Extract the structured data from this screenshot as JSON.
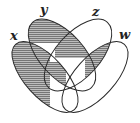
{
  "diagram": {
    "type": "venn-4-ellipses",
    "sets": [
      {
        "name": "x",
        "label": "x"
      },
      {
        "name": "y",
        "label": "y"
      },
      {
        "name": "z",
        "label": "z"
      },
      {
        "name": "w",
        "label": "w"
      }
    ],
    "shaded_regions": [
      "x only",
      "y only",
      "y∩z",
      "z∩w",
      "x∩y∩w",
      "z∩w∩x"
    ],
    "colors": {
      "stroke": "#2a2a2a",
      "shade": "#8a8a8a",
      "background": "#ffffff"
    }
  }
}
